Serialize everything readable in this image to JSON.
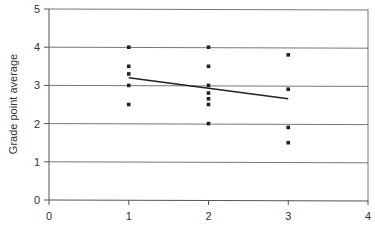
{
  "chart_data": {
    "type": "scatter",
    "title": "",
    "xlabel": "",
    "ylabel": "Grade point average",
    "xlim": [
      0,
      4
    ],
    "ylim": [
      0,
      5
    ],
    "x_ticks": [
      0,
      1,
      2,
      3,
      4
    ],
    "y_ticks": [
      0,
      1,
      2,
      3,
      4,
      5
    ],
    "grid": {
      "horizontal": true,
      "vertical": false
    },
    "legend": null,
    "series": [
      {
        "name": "data points",
        "type": "scatter",
        "points": [
          {
            "x": 1,
            "y": 4.0
          },
          {
            "x": 1,
            "y": 3.5
          },
          {
            "x": 1,
            "y": 3.3
          },
          {
            "x": 1,
            "y": 3.0
          },
          {
            "x": 1,
            "y": 2.5
          },
          {
            "x": 2,
            "y": 4.0
          },
          {
            "x": 2,
            "y": 3.5
          },
          {
            "x": 2,
            "y": 3.0
          },
          {
            "x": 2,
            "y": 2.8
          },
          {
            "x": 2,
            "y": 2.65
          },
          {
            "x": 2,
            "y": 2.5
          },
          {
            "x": 2,
            "y": 2.0
          },
          {
            "x": 3,
            "y": 3.8
          },
          {
            "x": 3,
            "y": 2.9
          },
          {
            "x": 3,
            "y": 1.9
          },
          {
            "x": 3,
            "y": 1.5
          }
        ]
      },
      {
        "name": "trend line",
        "type": "line",
        "points": [
          {
            "x": 1,
            "y": 3.2
          },
          {
            "x": 3,
            "y": 2.65
          }
        ]
      }
    ]
  },
  "colors": {
    "axis": "#555555",
    "grid": "#666666",
    "marker": "#222222",
    "line": "#222222"
  }
}
